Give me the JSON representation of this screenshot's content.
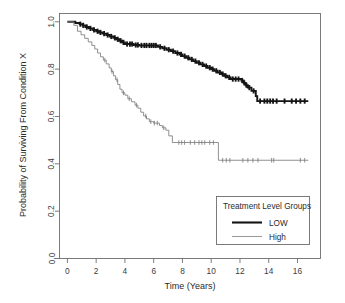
{
  "chart_data": {
    "type": "line",
    "subtype": "kaplan-meier-survival",
    "title": "",
    "xlabel": "Time (Years)",
    "ylabel": "Probability of Surviving From Condition X",
    "xlim": [
      -0.55,
      17.6
    ],
    "ylim": [
      0.0,
      1.035
    ],
    "grid": false,
    "xticks": [
      0,
      2,
      4,
      6,
      8,
      10,
      12,
      14,
      16
    ],
    "xticklabels": [
      "0",
      "2",
      "4",
      "6",
      "8",
      "10",
      "12",
      "14",
      "16"
    ],
    "yticks": [
      0.0,
      0.2,
      0.4,
      0.6,
      0.8,
      1.0
    ],
    "yticklabels": [
      "0.0",
      "0.2",
      "0.4",
      "0.6",
      "0.8",
      "1.0"
    ],
    "legend": {
      "title": "Treatment Level Groups",
      "position": "lower right",
      "entries": [
        {
          "label": "LOW",
          "color": "#151515",
          "linewidth": 2.1
        },
        {
          "label": "High",
          "color": "#8d8d8d",
          "linewidth": 0.9
        }
      ]
    },
    "series": [
      {
        "name": "LOW",
        "color": "#151515",
        "linewidth": 1.9,
        "steps": [
          [
            0.0,
            1.0
          ],
          [
            0.55,
            1.0
          ],
          [
            0.55,
            0.995
          ],
          [
            0.85,
            0.995
          ],
          [
            0.85,
            0.99
          ],
          [
            1.05,
            0.99
          ],
          [
            1.05,
            0.985
          ],
          [
            1.25,
            0.985
          ],
          [
            1.25,
            0.978
          ],
          [
            1.5,
            0.978
          ],
          [
            1.5,
            0.972
          ],
          [
            1.75,
            0.972
          ],
          [
            1.75,
            0.966
          ],
          [
            2.0,
            0.966
          ],
          [
            2.0,
            0.96
          ],
          [
            2.2,
            0.96
          ],
          [
            2.2,
            0.955
          ],
          [
            2.45,
            0.955
          ],
          [
            2.45,
            0.95
          ],
          [
            2.7,
            0.95
          ],
          [
            2.7,
            0.944
          ],
          [
            2.95,
            0.944
          ],
          [
            2.95,
            0.938
          ],
          [
            3.2,
            0.938
          ],
          [
            3.2,
            0.932
          ],
          [
            3.4,
            0.932
          ],
          [
            3.4,
            0.926
          ],
          [
            3.6,
            0.926
          ],
          [
            3.6,
            0.92
          ],
          [
            3.8,
            0.92
          ],
          [
            3.8,
            0.913
          ],
          [
            4.0,
            0.913
          ],
          [
            4.0,
            0.906
          ],
          [
            4.6,
            0.906
          ],
          [
            4.6,
            0.902
          ],
          [
            5.0,
            0.902
          ],
          [
            5.0,
            0.9
          ],
          [
            6.3,
            0.9
          ],
          [
            6.3,
            0.894
          ],
          [
            6.6,
            0.894
          ],
          [
            6.6,
            0.888
          ],
          [
            6.9,
            0.888
          ],
          [
            6.9,
            0.882
          ],
          [
            7.2,
            0.882
          ],
          [
            7.2,
            0.876
          ],
          [
            7.5,
            0.876
          ],
          [
            7.5,
            0.868
          ],
          [
            7.8,
            0.868
          ],
          [
            7.8,
            0.862
          ],
          [
            8.0,
            0.862
          ],
          [
            8.0,
            0.855
          ],
          [
            8.25,
            0.855
          ],
          [
            8.25,
            0.848
          ],
          [
            8.5,
            0.848
          ],
          [
            8.5,
            0.841
          ],
          [
            8.75,
            0.841
          ],
          [
            8.75,
            0.834
          ],
          [
            9.0,
            0.834
          ],
          [
            9.0,
            0.827
          ],
          [
            9.25,
            0.827
          ],
          [
            9.25,
            0.82
          ],
          [
            9.5,
            0.82
          ],
          [
            9.5,
            0.813
          ],
          [
            9.75,
            0.813
          ],
          [
            9.75,
            0.806
          ],
          [
            10.0,
            0.806
          ],
          [
            10.0,
            0.8
          ],
          [
            10.2,
            0.8
          ],
          [
            10.2,
            0.793
          ],
          [
            10.45,
            0.793
          ],
          [
            10.45,
            0.786
          ],
          [
            10.7,
            0.786
          ],
          [
            10.7,
            0.779
          ],
          [
            10.9,
            0.779
          ],
          [
            10.9,
            0.772
          ],
          [
            11.1,
            0.772
          ],
          [
            11.1,
            0.765
          ],
          [
            11.35,
            0.765
          ],
          [
            11.35,
            0.758
          ],
          [
            12.1,
            0.758
          ],
          [
            12.1,
            0.752
          ],
          [
            12.25,
            0.752
          ],
          [
            12.25,
            0.742
          ],
          [
            12.4,
            0.742
          ],
          [
            12.4,
            0.732
          ],
          [
            12.55,
            0.732
          ],
          [
            12.55,
            0.722
          ],
          [
            12.8,
            0.722
          ],
          [
            12.8,
            0.708
          ],
          [
            13.1,
            0.708
          ],
          [
            13.1,
            0.686
          ],
          [
            13.2,
            0.686
          ],
          [
            13.2,
            0.665
          ],
          [
            16.75,
            0.665
          ]
        ],
        "censor_times": [
          0.9,
          1.1,
          1.35,
          1.6,
          1.85,
          2.1,
          2.3,
          2.55,
          2.8,
          3.05,
          3.3,
          3.5,
          3.7,
          3.9,
          4.15,
          4.35,
          4.5,
          4.75,
          4.9,
          5.15,
          5.35,
          5.5,
          5.7,
          5.85,
          6.0,
          6.15,
          6.45,
          6.75,
          7.05,
          7.35,
          7.65,
          7.9,
          8.15,
          8.4,
          8.65,
          8.9,
          9.15,
          9.4,
          9.65,
          9.9,
          10.1,
          10.35,
          10.6,
          10.8,
          11.0,
          11.25,
          11.5,
          11.7,
          11.9,
          12.15,
          12.3,
          12.45,
          12.65,
          12.95,
          13.4,
          13.7,
          13.9,
          14.1,
          14.3,
          14.55,
          15.1,
          15.6,
          15.9,
          16.2,
          16.5
        ]
      },
      {
        "name": "High",
        "color": "#7d7d7d",
        "linewidth": 0.85,
        "steps": [
          [
            0.0,
            1.0
          ],
          [
            0.45,
            1.0
          ],
          [
            0.45,
            0.985
          ],
          [
            0.7,
            0.985
          ],
          [
            0.7,
            0.96
          ],
          [
            0.95,
            0.96
          ],
          [
            0.95,
            0.945
          ],
          [
            1.2,
            0.945
          ],
          [
            1.2,
            0.93
          ],
          [
            1.45,
            0.93
          ],
          [
            1.45,
            0.915
          ],
          [
            1.7,
            0.915
          ],
          [
            1.7,
            0.9
          ],
          [
            1.9,
            0.9
          ],
          [
            1.9,
            0.885
          ],
          [
            2.1,
            0.885
          ],
          [
            2.1,
            0.868
          ],
          [
            2.3,
            0.868
          ],
          [
            2.3,
            0.852
          ],
          [
            2.5,
            0.852
          ],
          [
            2.5,
            0.838
          ],
          [
            2.7,
            0.838
          ],
          [
            2.7,
            0.822
          ],
          [
            2.9,
            0.822
          ],
          [
            2.9,
            0.805
          ],
          [
            3.05,
            0.805
          ],
          [
            3.05,
            0.79
          ],
          [
            3.2,
            0.79
          ],
          [
            3.2,
            0.772
          ],
          [
            3.35,
            0.772
          ],
          [
            3.35,
            0.755
          ],
          [
            3.5,
            0.755
          ],
          [
            3.5,
            0.735
          ],
          [
            3.65,
            0.735
          ],
          [
            3.65,
            0.715
          ],
          [
            3.8,
            0.715
          ],
          [
            3.8,
            0.7
          ],
          [
            4.0,
            0.7
          ],
          [
            4.0,
            0.69
          ],
          [
            4.2,
            0.69
          ],
          [
            4.2,
            0.675
          ],
          [
            4.45,
            0.675
          ],
          [
            4.45,
            0.662
          ],
          [
            4.7,
            0.662
          ],
          [
            4.7,
            0.648
          ],
          [
            4.9,
            0.648
          ],
          [
            4.9,
            0.635
          ],
          [
            5.1,
            0.635
          ],
          [
            5.1,
            0.618
          ],
          [
            5.3,
            0.618
          ],
          [
            5.3,
            0.602
          ],
          [
            5.5,
            0.602
          ],
          [
            5.5,
            0.59
          ],
          [
            5.7,
            0.59
          ],
          [
            5.7,
            0.578
          ],
          [
            6.0,
            0.578
          ],
          [
            6.0,
            0.572
          ],
          [
            6.4,
            0.572
          ],
          [
            6.4,
            0.562
          ],
          [
            6.6,
            0.562
          ],
          [
            6.6,
            0.552
          ],
          [
            6.85,
            0.552
          ],
          [
            6.85,
            0.542
          ],
          [
            7.05,
            0.542
          ],
          [
            7.05,
            0.518
          ],
          [
            7.3,
            0.518
          ],
          [
            7.3,
            0.49
          ],
          [
            10.5,
            0.49
          ],
          [
            10.5,
            0.415
          ],
          [
            16.75,
            0.415
          ]
        ],
        "censor_times": [
          2.6,
          3.1,
          3.45,
          3.9,
          4.3,
          4.8,
          5.45,
          5.8,
          6.05,
          6.25,
          6.7,
          7.75,
          7.95,
          8.15,
          8.55,
          8.85,
          9.15,
          9.35,
          9.55,
          9.9,
          10.15,
          10.8,
          11.05,
          11.3,
          12.2,
          12.55,
          12.9,
          13.25,
          14.2,
          14.35,
          16.2,
          16.5
        ]
      }
    ]
  },
  "axes": {
    "x_title": "Time (Years)",
    "y_title": "Probability of Surviving From Condition X"
  },
  "legend": {
    "title": "Treatment Level Groups",
    "low_label": "LOW",
    "high_label": "High"
  },
  "colors": {
    "low": "#151515",
    "high": "#7d7d7d",
    "frame": "#6d6d6d",
    "text": "#2b2b2b",
    "background": "#ffffff"
  }
}
